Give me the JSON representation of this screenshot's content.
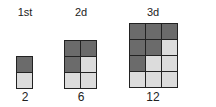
{
  "figures": [
    {
      "label": "1st",
      "count": "2",
      "cols": 1,
      "rows": 2,
      "cells": [
        "dark",
        "light"
      ]
    },
    {
      "label": "2d",
      "count": "6",
      "cols": 2,
      "rows": 3,
      "cells": [
        "dark",
        "dark",
        "dark",
        "light",
        "light",
        "light"
      ]
    },
    {
      "label": "3d",
      "count": "12",
      "cols": 3,
      "rows": 4,
      "cells": [
        "dark",
        "dark",
        "dark",
        "dark",
        "dark",
        "light",
        "dark",
        "light",
        "light",
        "light",
        "light",
        "light"
      ]
    }
  ],
  "colors": {
    "dark_cell": "#6b6b6b",
    "light_cell": "#dcdcdc",
    "border": "#222222"
  }
}
